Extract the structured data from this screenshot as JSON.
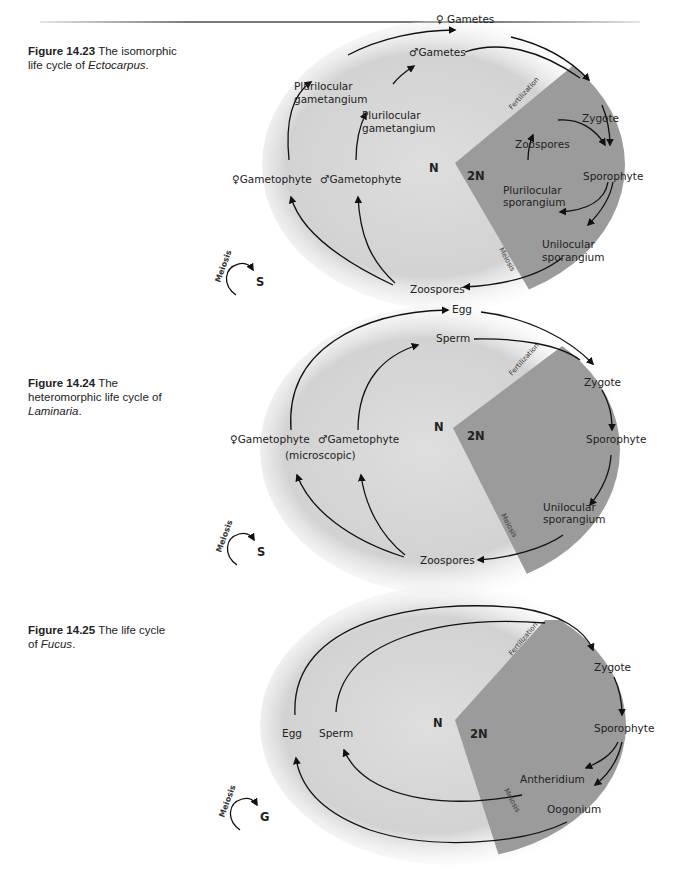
{
  "figures": [
    {
      "number": "Figure 14.23",
      "caption_pre": "The isomorphic life cycle of ",
      "caption_italic": "Ectocarpus",
      "caption_post": ".",
      "labels": {
        "female_gametes": "♀ Gametes",
        "male_gametes": "♂Gametes",
        "pluri_gam_1a": "Plurilocular",
        "pluri_gam_1b": "gametangium",
        "pluri_gam_2a": "Plurilocular",
        "pluri_gam_2b": "gametangium",
        "female_gametophyte": "♀Gametophyte",
        "male_gametophyte": "♂Gametophyte",
        "n": "N",
        "two_n": "2N",
        "zygote": "Zygote",
        "sporophyte": "Sporophyte",
        "zoospores_inner": "Zoospores",
        "pluri_spor_a": "Plurilocular",
        "pluri_spor_b": "sporangium",
        "uni_spor_a": "Unilocular",
        "uni_spor_b": "sporangium",
        "zoospores": "Zoospores",
        "fertilization": "Fertilization",
        "meiosis": "Meiosis"
      },
      "legend": {
        "word": "Meiosis",
        "letter": "S"
      }
    },
    {
      "number": "Figure 14.24",
      "caption_pre": "The heteromorphic life cycle of ",
      "caption_italic": "Laminaria",
      "caption_post": ".",
      "labels": {
        "egg": "Egg",
        "sperm": "Sperm",
        "female_gametophyte": "♀Gametophyte",
        "male_gametophyte": "♂Gametophyte",
        "microscopic": "(microscopic)",
        "n": "N",
        "two_n": "2N",
        "zygote": "Zygote",
        "sporophyte": "Sporophyte",
        "uni_spor_a": "Unilocular",
        "uni_spor_b": "sporangium",
        "zoospores": "Zoospores",
        "fertilization": "Fertilization",
        "meiosis": "Meiosis"
      },
      "legend": {
        "word": "Meiosis",
        "letter": "S"
      }
    },
    {
      "number": "Figure 14.25",
      "caption_pre": "The life cycle of ",
      "caption_italic": "Fucus",
      "caption_post": ".",
      "labels": {
        "egg": "Egg",
        "sperm": "Sperm",
        "n": "N",
        "two_n": "2N",
        "zygote": "Zygote",
        "sporophyte": "Sporophyte",
        "antheridium": "Antheridium",
        "oogonium": "Oogonium",
        "fertilization": "Fertilization",
        "meiosis": "Meiosis"
      },
      "legend": {
        "word": "Meiosis",
        "letter": "G"
      }
    }
  ],
  "colors": {
    "haploid_fill": "#d9d9d9",
    "diploid_fill": "#9a9a9a",
    "arrow": "#111111"
  }
}
